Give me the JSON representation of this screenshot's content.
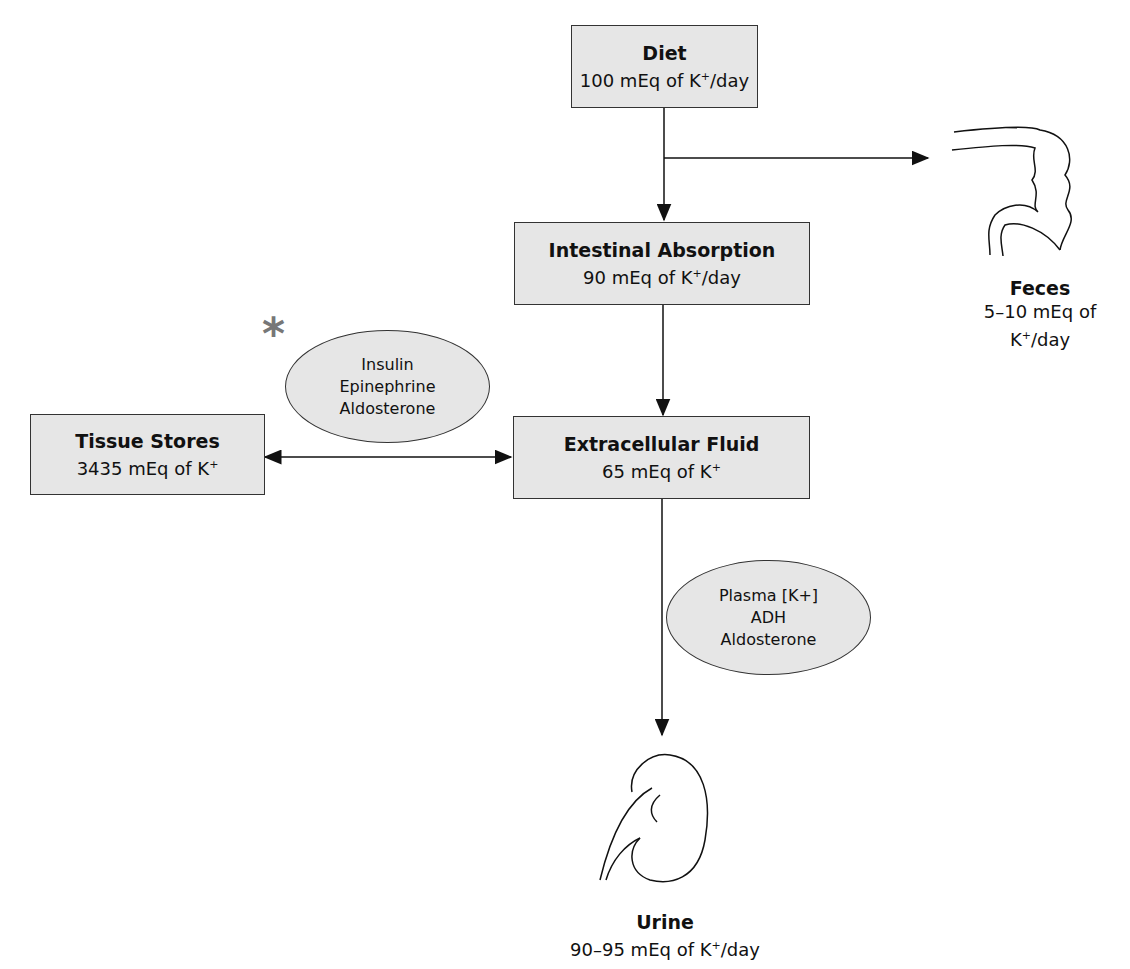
{
  "nodes": {
    "diet": {
      "title": "Diet",
      "value": "100 mEq of K",
      "unit": "/day"
    },
    "intestinal": {
      "title": "Intestinal Absorption",
      "value": "90 mEq of K",
      "unit": "/day"
    },
    "ecf": {
      "title": "Extracellular Fluid",
      "value": "65 mEq of K",
      "unit": ""
    },
    "tissue": {
      "title": "Tissue Stores",
      "value": "3435 mEq of K",
      "unit": ""
    },
    "feces": {
      "title": "Feces",
      "value": "5–10 mEq of K",
      "unit": "/day"
    },
    "urine": {
      "title": "Urine",
      "value": "90–95 mEq of K",
      "unit": "/day"
    }
  },
  "superscript": "+",
  "regulators": {
    "tissue_shift": [
      "Insulin",
      "Epinephrine",
      "Aldosterone"
    ],
    "renal": [
      "Plasma [K+]",
      "ADH",
      "Aldosterone"
    ]
  },
  "marker": "*"
}
